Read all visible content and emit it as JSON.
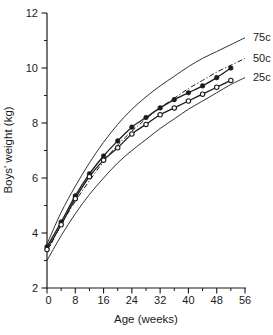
{
  "chart_data": {
    "type": "line",
    "title": "",
    "xlabel": "Age (weeks)",
    "ylabel": "Boys' weight (kg)",
    "xlim": [
      0,
      56
    ],
    "ylim": [
      2,
      12
    ],
    "grid": "off",
    "legend_position": "inline-right-curve-labels",
    "x_major_ticks": [
      0,
      8,
      16,
      24,
      32,
      40,
      48,
      56
    ],
    "x_minor_ticks": [
      4,
      12,
      20,
      28,
      36,
      44,
      52
    ],
    "y_major_ticks": [
      2,
      4,
      6,
      8,
      10,
      12
    ],
    "y_minor_ticks": [
      3,
      5,
      7,
      9,
      11
    ],
    "colors": {
      "line": "#1b1b1b",
      "background": "#ffffff"
    },
    "series": [
      {
        "name": "75th-centile-reference-curve",
        "label": "75c",
        "style": "solid-thin",
        "marker": "none",
        "x": [
          0,
          4,
          8,
          12,
          16,
          20,
          24,
          28,
          32,
          36,
          40,
          44,
          48,
          52,
          56
        ],
        "values": [
          3.6,
          4.75,
          5.7,
          6.55,
          7.3,
          7.95,
          8.5,
          8.95,
          9.35,
          9.7,
          10.05,
          10.35,
          10.6,
          10.85,
          11.1
        ]
      },
      {
        "name": "50th-centile-reference-curve",
        "label": "50c",
        "style": "dash-dot",
        "marker": "none",
        "x": [
          0,
          4,
          8,
          12,
          16,
          20,
          24,
          28,
          32,
          36,
          40,
          44,
          48,
          52,
          56
        ],
        "values": [
          3.3,
          4.3,
          5.15,
          5.9,
          6.6,
          7.2,
          7.7,
          8.15,
          8.55,
          8.9,
          9.25,
          9.55,
          9.85,
          10.1,
          10.35
        ]
      },
      {
        "name": "25th-centile-reference-curve",
        "label": "25c",
        "style": "solid-thin",
        "marker": "none",
        "x": [
          0,
          4,
          8,
          12,
          16,
          20,
          24,
          28,
          32,
          36,
          40,
          44,
          48,
          52,
          56
        ],
        "values": [
          3.0,
          3.9,
          4.7,
          5.4,
          6.0,
          6.55,
          7.0,
          7.4,
          7.8,
          8.15,
          8.5,
          8.8,
          9.1,
          9.4,
          9.65
        ]
      },
      {
        "name": "observed-weight-filled-circles",
        "label": "",
        "style": "solid",
        "marker": "filled-circle",
        "x": [
          0,
          4,
          8,
          12,
          16,
          20,
          24,
          28,
          32,
          36,
          40,
          44,
          48,
          52
        ],
        "values": [
          3.5,
          4.4,
          5.35,
          6.15,
          6.8,
          7.35,
          7.85,
          8.2,
          8.55,
          8.85,
          9.1,
          9.35,
          9.65,
          10.0
        ]
      },
      {
        "name": "observed-weight-open-circles",
        "label": "",
        "style": "solid",
        "marker": "open-circle",
        "x": [
          0,
          4,
          8,
          12,
          16,
          20,
          24,
          28,
          32,
          36,
          40,
          44,
          48,
          52
        ],
        "values": [
          3.4,
          4.3,
          5.25,
          6.05,
          6.65,
          7.1,
          7.6,
          7.95,
          8.3,
          8.55,
          8.8,
          9.05,
          9.3,
          9.55
        ]
      }
    ]
  }
}
